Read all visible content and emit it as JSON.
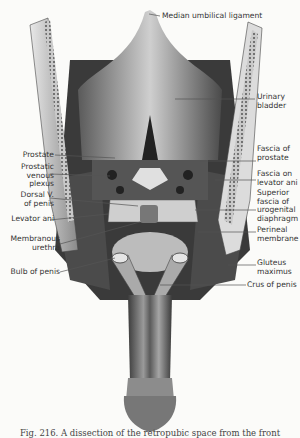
{
  "figure": {
    "labels_top": {
      "median_umbilical_ligament": "Median umbilical ligament"
    },
    "labels_left": [
      {
        "id": "prostate",
        "text": "Prostate"
      },
      {
        "id": "prostatic_venous_plexus",
        "text": "Prostatic\nvenous\nplexus"
      },
      {
        "id": "dorsal_v_of_penis",
        "text": "Dorsal V.\nof penis"
      },
      {
        "id": "levator_ani",
        "text": "Levator ani"
      },
      {
        "id": "membranous_urethra",
        "text": "Membranous\nurethra"
      },
      {
        "id": "bulb_of_penis",
        "text": "Bulb of penis"
      }
    ],
    "labels_right": [
      {
        "id": "urinary_bladder",
        "text": "Urinary\nbladder"
      },
      {
        "id": "fascia_of_prostate",
        "text": "Fascia of\nprostate"
      },
      {
        "id": "fascia_on_levator_ani",
        "text": "Fascia on\nlevator ani"
      },
      {
        "id": "superior_fascia_urogenital_diaphragm",
        "text": "Superior\nfascia of\nurogenital\ndiaphragm"
      },
      {
        "id": "perineal_membrane",
        "text": "Perineal\nmembrane"
      },
      {
        "id": "gluteus_maximus",
        "text": "Gluteus\nmaximus"
      },
      {
        "id": "crus_of_penis",
        "text": "Crus of penis"
      }
    ],
    "caption": "Fig. 216.  A dissection of the retropubic space from the front"
  }
}
